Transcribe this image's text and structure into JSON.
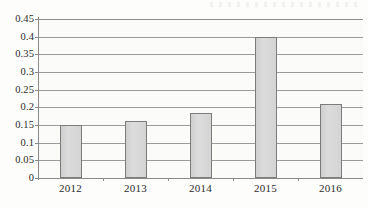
{
  "chart_data": {
    "type": "bar",
    "title": "",
    "xlabel": "",
    "ylabel": "",
    "categories": [
      "2012",
      "2013",
      "2014",
      "2015",
      "2016"
    ],
    "values": [
      0.15,
      0.16,
      0.185,
      0.4,
      0.21
    ],
    "series": [
      {
        "name": "",
        "values": [
          0.15,
          0.16,
          0.185,
          0.4,
          0.21
        ]
      }
    ],
    "ylim": [
      0,
      0.45
    ],
    "ytick_step": 0.05,
    "ytick_labels": [
      "0.45",
      "0.4",
      "0.35",
      "0.3",
      "0.25",
      "0.2",
      "0.15",
      "0.1",
      "0.05",
      "0"
    ],
    "ytick_values": [
      0.45,
      0.4,
      0.35,
      0.3,
      0.25,
      0.2,
      0.15,
      0.1,
      0.05,
      0
    ],
    "grid": true,
    "grid_orientation": "horizontal",
    "legend": false,
    "legend_position": "none",
    "bar_fill_color": "#d6d6d6",
    "bar_border_color": "#7c7c7c",
    "gridline_color": "#9b9b9b",
    "axis_color": "#8a8a8a",
    "background_color": "#fbfbfa",
    "annotations": []
  },
  "ticks": [
    {
      "label": "0.45",
      "value": 0.45
    },
    {
      "label": "0.4",
      "value": 0.4
    },
    {
      "label": "0.35",
      "value": 0.35
    },
    {
      "label": "0.3",
      "value": 0.3
    },
    {
      "label": "0.25",
      "value": 0.25
    },
    {
      "label": "0.2",
      "value": 0.2
    },
    {
      "label": "0.15",
      "value": 0.15
    },
    {
      "label": "0.1",
      "value": 0.1
    },
    {
      "label": "0.05",
      "value": 0.05
    },
    {
      "label": "0",
      "value": 0
    }
  ],
  "bars": [
    {
      "category": "2012",
      "value": 0.15
    },
    {
      "category": "2013",
      "value": 0.16
    },
    {
      "category": "2014",
      "value": 0.185
    },
    {
      "category": "2015",
      "value": 0.4
    },
    {
      "category": "2016",
      "value": 0.21
    }
  ]
}
